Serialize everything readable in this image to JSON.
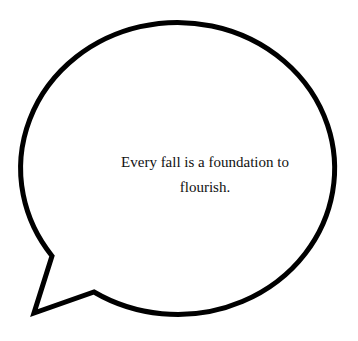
{
  "speech_bubble": {
    "text_line_1": "Every fall is a foundation to",
    "text_line_2": "flourish.",
    "stroke_color": "#000000",
    "fill_color": "#ffffff"
  }
}
